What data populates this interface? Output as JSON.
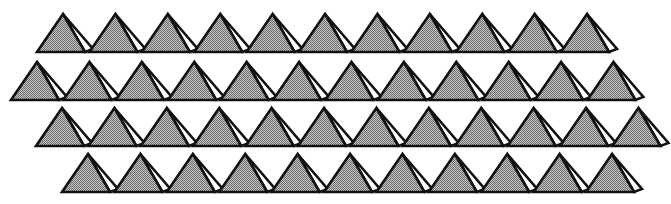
{
  "diagram": {
    "colors": {
      "background": "#ffffff",
      "face_shaded": "#a9a9a9",
      "face_light": "#ffffff",
      "outline": "#111111"
    },
    "unit": {
      "half_base_left": 26,
      "half_base_right": 22,
      "height": 38,
      "side_face_dx": 30,
      "side_face_dy": 35
    },
    "spacing_x": 52.4,
    "rows": [
      {
        "apex_x": 63,
        "apex_y": 14,
        "count": 11
      },
      {
        "apex_x": 37,
        "apex_y": 62,
        "count": 12
      },
      {
        "apex_x": 62,
        "apex_y": 108,
        "count": 12
      },
      {
        "apex_x": 88,
        "apex_y": 154,
        "count": 11
      }
    ]
  }
}
